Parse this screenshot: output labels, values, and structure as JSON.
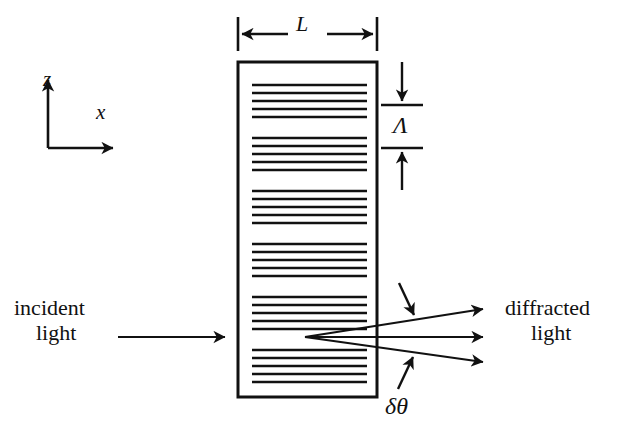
{
  "figure": {
    "width": 618,
    "height": 434,
    "background_color": "#ffffff",
    "stroke_color": "#111111"
  },
  "axes": {
    "z_label": "z",
    "x_label": "x",
    "origin": {
      "x": 48,
      "y": 148
    },
    "z_tip": {
      "x": 48,
      "y": 75
    },
    "x_tip": {
      "x": 118,
      "y": 148
    }
  },
  "grating": {
    "name": "grating-slab",
    "left": 238,
    "top": 62,
    "right": 377,
    "bottom": 397,
    "border_width": 3,
    "fringe_left": 252,
    "fringe_right": 367,
    "fringe_group_count": 6,
    "lines_per_group": 5,
    "line_spacing": 8,
    "group_period": 53,
    "first_group_top": 85,
    "line_width": 2.4
  },
  "dimensions": {
    "length_label": "L",
    "length_tick_left_x": 238,
    "length_tick_right_x": 377,
    "length_line_y": 34,
    "length_tick_top": 17,
    "length_tick_bottom": 51,
    "period_label": "Λ",
    "period_tick_x_start": 381,
    "period_tick_x_end": 423,
    "period_tick_upper_y": 105,
    "period_tick_lower_y": 148,
    "period_arrow_top_y": 62,
    "period_arrow_bottom_y": 190
  },
  "beams": {
    "incident": {
      "label_line1": "incident",
      "label_line2": "light",
      "arrow_start": {
        "x": 118,
        "y": 337
      },
      "arrow_end": {
        "x": 229,
        "y": 337
      }
    },
    "diffracted": {
      "label_line1": "diffracted",
      "label_line2": "light",
      "origin": {
        "x": 305,
        "y": 337
      },
      "rays": [
        {
          "name": "upper-diffracted-ray",
          "end_x": 487,
          "end_y": 309
        },
        {
          "name": "central-diffracted-ray",
          "end_x": 487,
          "end_y": 337
        },
        {
          "name": "lower-diffracted-ray",
          "end_x": 487,
          "end_y": 362
        }
      ]
    },
    "angular_spread": {
      "label": "δθ",
      "upper_pointer": {
        "from_x": 399,
        "from_y": 283,
        "to_x": 416,
        "to_y": 318
      },
      "lower_pointer": {
        "from_x": 398,
        "from_y": 389,
        "to_x": 415,
        "to_y": 354
      }
    }
  }
}
